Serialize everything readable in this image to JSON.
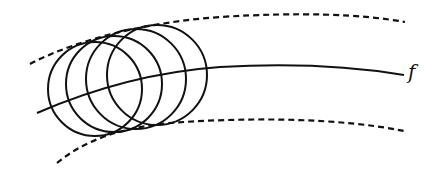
{
  "diagram": {
    "curve_label": "f",
    "colors": {
      "stroke": "#111111",
      "background": "#ffffff"
    },
    "curve_f": {
      "style": "solid",
      "path": "M37,113 C90,90 150,72 220,67 C290,63 350,66 404,75"
    },
    "upper_envelope": {
      "style": "dashed",
      "path": "M30,64 C80,38 150,22 220,17 C300,12 360,14 405,22"
    },
    "lower_envelope": {
      "style": "dashed",
      "path": "M57,163 C85,140 120,128 170,123 C250,117 340,118 404,131"
    },
    "circles": [
      {
        "cx": 95,
        "cy": 89,
        "r": 47
      },
      {
        "cx": 114,
        "cy": 84,
        "r": 48
      },
      {
        "cx": 136,
        "cy": 79,
        "r": 50
      },
      {
        "cx": 157,
        "cy": 75,
        "r": 50
      }
    ]
  }
}
